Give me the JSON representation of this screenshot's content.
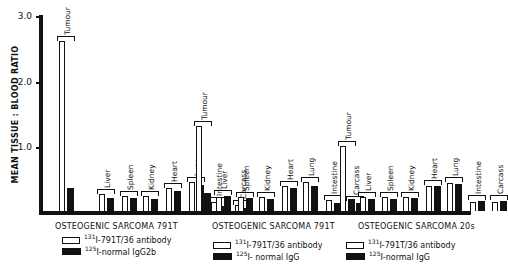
{
  "chart_data": {
    "type": "bar",
    "ylabel": "MEAN TISSUE : BLOOD RATIO",
    "ylim": [
      0,
      3.0
    ],
    "yticks": [
      "1.0",
      "2.0",
      "3.0"
    ],
    "categories": [
      "Tumour",
      "Liver",
      "Spleen",
      "Kidney",
      "Heart",
      "Lung",
      "Intestine",
      "Carcass"
    ],
    "panels": [
      {
        "title": "OSTEOGENIC SARCOMA 791T",
        "legend": [
          {
            "iso": "131",
            "label": "I-791T/36 antibody",
            "style": "open"
          },
          {
            "iso": "125",
            "label": "I-normal IgG2b",
            "style": "filled"
          }
        ],
        "series": [
          {
            "name": "131I-791T/36 antibody",
            "values": [
              2.58,
              0.25,
              0.22,
              0.22,
              0.33,
              0.43,
              0.12,
              0.07
            ]
          },
          {
            "name": "125I-normal IgG2b",
            "values": [
              0.35,
              0.2,
              0.2,
              0.18,
              0.3,
              0.4,
              0.08,
              0.05
            ]
          }
        ]
      },
      {
        "title": "OSTEOGENIC SARCOMA 791T",
        "legend": [
          {
            "iso": "131",
            "label": "I-791T/36 antibody",
            "style": "open"
          },
          {
            "iso": "125",
            "label": "I- normal IgG",
            "style": "filled"
          }
        ],
        "series": [
          {
            "name": "131I-791T/36 antibody",
            "values": [
              1.28,
              0.2,
              0.2,
              0.2,
              0.37,
              0.43,
              0.15,
              0.13
            ]
          },
          {
            "name": "125I- normal IgG",
            "values": [
              0.27,
              0.23,
              0.2,
              0.19,
              0.35,
              0.38,
              0.13,
              0.12
            ]
          }
        ]
      },
      {
        "title": "OSTEOGENIC SARCOMA 20s",
        "legend": [
          {
            "iso": "131",
            "label": "I-791T/36 antibody",
            "style": "open"
          },
          {
            "iso": "125",
            "label": "I-normal IgG",
            "style": "filled"
          }
        ],
        "series": [
          {
            "name": "131I-791T/36 antibody",
            "values": [
              0.97,
              0.2,
              0.2,
              0.2,
              0.37,
              0.42,
              0.13,
              0.13
            ]
          },
          {
            "name": "125I-normal IgG",
            "values": [
              0.18,
              0.18,
              0.18,
              0.2,
              0.38,
              0.42,
              0.15,
              0.16
            ]
          }
        ]
      }
    ]
  }
}
